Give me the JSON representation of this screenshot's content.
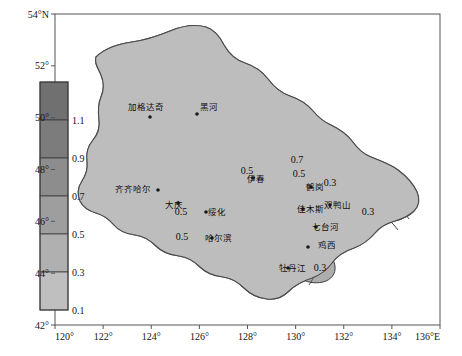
{
  "figure": {
    "kind": "contour-map",
    "region_name": "Heilongjiang",
    "background_color": "#ffffff",
    "frame_color": "#5a5a5a"
  },
  "axes": {
    "x_axis": {
      "name": "longitude",
      "min": 120,
      "max": 136,
      "step": 2,
      "ticks": [
        "120°",
        "122°",
        "124°",
        "126°",
        "128°",
        "130°",
        "132°",
        "134°",
        "136°E"
      ],
      "unit_suffix": "E"
    },
    "y_axis": {
      "name": "latitude",
      "min": 42,
      "max": 54,
      "step": 2,
      "ticks": [
        "42°",
        "44°",
        "46°",
        "48°",
        "50°",
        "52°",
        "54°N"
      ],
      "unit_suffix": "N"
    }
  },
  "colorbar": {
    "orientation": "vertical",
    "min": 0.1,
    "max": 1.3,
    "step": 0.2,
    "tick_labels": [
      "1.1",
      "0.9",
      "0.7",
      "0.5",
      "0.3",
      "0.1"
    ],
    "swatch_colors": [
      "#707070",
      "#7c7c7c",
      "#8d8d8d",
      "#9e9e9e",
      "#b0b0b0",
      "#bfbfbf"
    ],
    "border_color": "#3a3a3a"
  },
  "chart_data": {
    "type": "heatmap",
    "title": "",
    "xlabel": "",
    "ylabel": "",
    "xlim": [
      120,
      136
    ],
    "ylim": [
      42,
      54
    ],
    "grid": false,
    "legend": "colorbar-left",
    "contour_levels": [
      0.1,
      0.3,
      0.5,
      0.7,
      0.9,
      1.1,
      1.3
    ],
    "contour_labels": [
      {
        "value": "0.7",
        "x": 297,
        "y": 163
      },
      {
        "value": "0.5",
        "x": 299,
        "y": 177
      },
      {
        "value": "0.5",
        "x": 181,
        "y": 215
      },
      {
        "value": "0.5",
        "x": 182,
        "y": 240
      },
      {
        "value": "0.3",
        "x": 330,
        "y": 186
      },
      {
        "value": "0.3",
        "x": 368,
        "y": 215
      },
      {
        "value": "0.3",
        "x": 320,
        "y": 271
      },
      {
        "value": "0.5",
        "x": 247,
        "y": 174
      }
    ],
    "fill_colors": [
      "#bfbfbf",
      "#b0b0b0",
      "#9e9e9e",
      "#8d8d8d",
      "#7c7c7c",
      "#707070"
    ]
  },
  "cities": [
    {
      "name": "加格达奇",
      "x": 128,
      "y": 110,
      "dot_x": 150,
      "dot_y": 117
    },
    {
      "name": "黑河",
      "x": 200,
      "y": 110,
      "dot_x": 197,
      "dot_y": 114
    },
    {
      "name": "齐齐哈尔",
      "x": 115,
      "y": 192,
      "dot_x": 158,
      "dot_y": 190
    },
    {
      "name": "大庆",
      "x": 165,
      "y": 208,
      "dot_x": 178,
      "dot_y": 203
    },
    {
      "name": "伊春",
      "x": 247,
      "y": 182,
      "dot_x": 253,
      "dot_y": 178
    },
    {
      "name": "绥化",
      "x": 208,
      "y": 215,
      "dot_x": 206,
      "dot_y": 212
    },
    {
      "name": "哈尔滨",
      "x": 205,
      "y": 241,
      "dot_x": 212,
      "dot_y": 238
    },
    {
      "name": "鹤岗",
      "x": 306,
      "y": 190,
      "dot_x": 311,
      "dot_y": 187
    },
    {
      "name": "佳木斯",
      "x": 297,
      "y": 212,
      "dot_x": 303,
      "dot_y": 209
    },
    {
      "name": "双鸭山",
      "x": 324,
      "y": 208,
      "dot_x": 330,
      "dot_y": 205
    },
    {
      "name": "七台河",
      "x": 312,
      "y": 230,
      "dot_x": 316,
      "dot_y": 227
    },
    {
      "name": "鸡西",
      "x": 318,
      "y": 248,
      "dot_x": 308,
      "dot_y": 247
    },
    {
      "name": "牡丹江",
      "x": 279,
      "y": 271,
      "dot_x": 288,
      "dot_y": 268
    }
  ]
}
